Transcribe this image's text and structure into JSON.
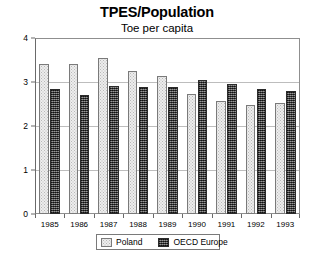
{
  "chart_data": {
    "type": "bar",
    "title": "TPES/Population",
    "subtitle": "Toe per capita",
    "xlabel": "",
    "ylabel": "",
    "ylim": [
      0,
      4
    ],
    "yticks": [
      "0",
      "1",
      "2",
      "3",
      "4"
    ],
    "ytick_values": [
      0,
      1,
      2,
      3,
      4
    ],
    "grid": true,
    "grid_axis": "y",
    "legend_position": "bottom-center",
    "categories": [
      "1985",
      "1986",
      "1987",
      "1988",
      "1989",
      "1990",
      "1991",
      "1992",
      "1993"
    ],
    "series": [
      {
        "name": "Poland",
        "color": "#ededed",
        "pattern": "light-dotted",
        "values": [
          3.4,
          3.42,
          3.55,
          3.25,
          3.13,
          2.72,
          2.57,
          2.47,
          2.53
        ]
      },
      {
        "name": "OECD Europe",
        "color": "#4b4b4b",
        "pattern": "dark-checkered",
        "values": [
          2.85,
          2.7,
          2.9,
          2.88,
          2.88,
          3.05,
          2.95,
          2.83,
          2.8
        ]
      }
    ]
  },
  "colors": {
    "background": "#ffffff",
    "frame": "#8f8f8f",
    "gridline": "#bdbdbd",
    "text": "#000000",
    "poland": "#ededed",
    "oecd": "#4b4b4b"
  }
}
